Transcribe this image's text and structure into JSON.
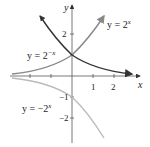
{
  "axes": {
    "x_label": "x",
    "y_label": "y",
    "x_ticks": [
      "1",
      "2"
    ],
    "y_ticks": [
      "2",
      "1",
      "-1",
      "-2"
    ]
  },
  "curves": [
    {
      "name": "2^x",
      "label": "y = 2",
      "exp": "x",
      "color": "#888888"
    },
    {
      "name": "2^-x",
      "label": "y = 2",
      "exp": "−x",
      "color": "#333333"
    },
    {
      "name": "-2^x",
      "label": "y = −2",
      "exp": "x",
      "color": "#bbbbbb"
    }
  ],
  "labels": {
    "y_tick_1": "1",
    "y_tick_2": "2",
    "y_tick_m1": "−1",
    "y_tick_m2": "−2",
    "x_tick_1": "1",
    "x_tick_2": "2"
  }
}
